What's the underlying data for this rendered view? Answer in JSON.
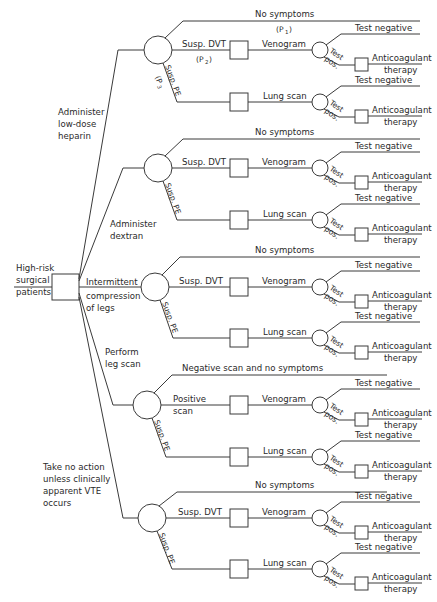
{
  "root": {
    "label_lines": [
      "High-risk",
      "surgical",
      "patients"
    ]
  },
  "strategies": [
    {
      "label_lines": [
        "Administer",
        "low-dose",
        "heparin"
      ],
      "top_outcome": "No symptoms",
      "top_prob": "(P",
      "top_prob_sub": "1",
      "dvt_label": "Susp. DVT",
      "dvt_prob": "(P",
      "dvt_prob_sub": "2",
      "pe_label": "Susp. PE",
      "pe_prob": "(P",
      "pe_prob_sub": "3"
    },
    {
      "label_lines": [
        "Administer",
        "dextran"
      ],
      "top_outcome": "No symptoms",
      "dvt_label": "Susp. DVT",
      "pe_label": "Susp. PE"
    },
    {
      "label_lines": [
        "Intermittent",
        "compression",
        "of legs"
      ],
      "top_outcome": "No symptoms",
      "dvt_label": "Susp. DVT",
      "pe_label": "Susp. PE"
    },
    {
      "label_lines": [
        "Perform",
        "leg scan"
      ],
      "top_outcome": "Negative scan and no symptoms",
      "dvt_label_lines": [
        "Positive",
        "scan"
      ],
      "pe_label": "Susp. PE"
    },
    {
      "label_lines": [
        "Take no action",
        "unless clinically",
        "apparent VTE",
        "occurs"
      ],
      "top_outcome": "No symptoms",
      "dvt_label": "Susp. DVT",
      "pe_label": "Susp. PE"
    }
  ],
  "tests": {
    "venogram": "Venogram",
    "lung_scan": "Lung scan",
    "test_negative": "Test negative",
    "test_pos_1": "Test",
    "test_pos_2": "pos.",
    "therapy_1": "Anticoagulant",
    "therapy_2": "therapy"
  }
}
